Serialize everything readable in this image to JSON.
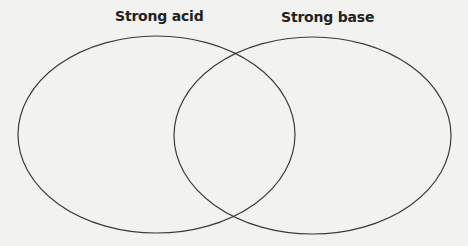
{
  "diagram": {
    "type": "venn",
    "sets": [
      {
        "label": "Strong acid",
        "cx": 156.5,
        "cy": 134.5,
        "rx": 138.5,
        "ry": 98.5
      },
      {
        "label": "Strong base",
        "cx": 312.5,
        "cy": 135.5,
        "rx": 138.5,
        "ry": 98.5
      }
    ],
    "stroke_color": "#3a3a3a",
    "background": "#f2f2f0"
  }
}
